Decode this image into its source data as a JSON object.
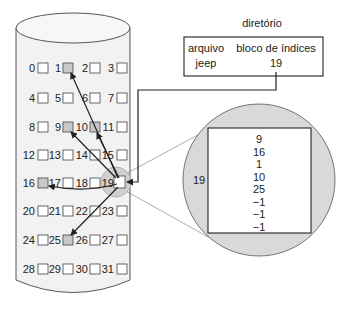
{
  "directory": {
    "title": "diretório",
    "headers": [
      "arquivo",
      "bloco de índices"
    ],
    "row": {
      "file": "jeep",
      "index_block": "19"
    }
  },
  "disk": {
    "blocks": [
      "0",
      "1",
      "2",
      "3",
      "4",
      "5",
      "6",
      "7",
      "8",
      "9",
      "10",
      "11",
      "12",
      "13",
      "14",
      "15",
      "16",
      "17",
      "18",
      "19",
      "20",
      "21",
      "22",
      "23",
      "24",
      "25",
      "26",
      "27",
      "28",
      "29",
      "30",
      "31"
    ],
    "used_blocks": [
      "1",
      "9",
      "10",
      "16",
      "25"
    ],
    "index_block": "19"
  },
  "index_block_detail": {
    "label": "19",
    "entries": [
      "9",
      "16",
      "1",
      "10",
      "25",
      "−1",
      "−1",
      "−1"
    ]
  },
  "colors": {
    "used_block_fill": "#c8c8c8",
    "cylinder_fill": "#f2f2f2",
    "magnifier_fill": "#d6d6d6",
    "stroke": "#333333"
  }
}
